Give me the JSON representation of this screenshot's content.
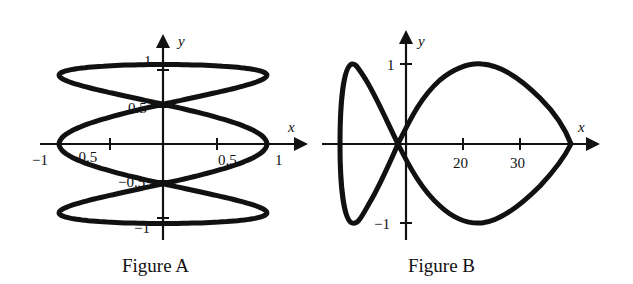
{
  "chart_data": [
    {
      "type": "line",
      "title": "Figure A",
      "xlabel": "x",
      "ylabel": "y",
      "xlim": [
        -1,
        1
      ],
      "ylim": [
        -1,
        1
      ],
      "x_ticks": [
        "−1",
        "−0.5",
        "0.5",
        "1"
      ],
      "y_ticks": [
        "1",
        "0.5",
        "−0.5",
        "−1"
      ],
      "curve": "parametric closed curve with 4 outer lobes crossing at origin; extremes x=±1, y=±0.9",
      "sample_points": [
        [
          0,
          0
        ],
        [
          0.6,
          0.5
        ],
        [
          0.9,
          0.9
        ],
        [
          1,
          0
        ],
        [
          0.6,
          -0.5
        ],
        [
          0.9,
          -0.9
        ],
        [
          0,
          -0.85
        ],
        [
          -0.9,
          -0.9
        ],
        [
          -0.6,
          -0.5
        ],
        [
          -1,
          0
        ],
        [
          -0.9,
          0.9
        ],
        [
          0,
          0.85
        ],
        [
          -0.6,
          0.5
        ]
      ]
    },
    {
      "type": "line",
      "title": "Figure B",
      "xlabel": "x",
      "ylabel": "y",
      "x_ticks": [
        "20",
        "30"
      ],
      "y_ticks": [
        "1",
        "−1"
      ],
      "ylim": [
        -1,
        1
      ],
      "curve": "closed parametric curve: small left loop and large right lobe meeting at a cusp near x≈39",
      "sample_points": [
        [
          0,
          0
        ],
        [
          20,
          1
        ],
        [
          39,
          0
        ],
        [
          20,
          -1
        ],
        [
          0,
          0
        ],
        [
          -8,
          1
        ],
        [
          -11,
          0
        ],
        [
          -8,
          -1
        ]
      ]
    }
  ],
  "figureA": {
    "caption": "Figure A",
    "x_label": "x",
    "y_label": "y",
    "ticks": {
      "xm1": "−1",
      "xm05": "−0.5",
      "x05": "0.5",
      "x1": "1",
      "y1": "1",
      "y05": "0.5",
      "ym05": "−0.5",
      "ym1": "−1"
    }
  },
  "figureB": {
    "caption": "Figure B",
    "x_label": "x",
    "y_label": "y",
    "ticks": {
      "x20": "20",
      "x30": "30",
      "y1": "1",
      "ym1": "−1"
    }
  }
}
